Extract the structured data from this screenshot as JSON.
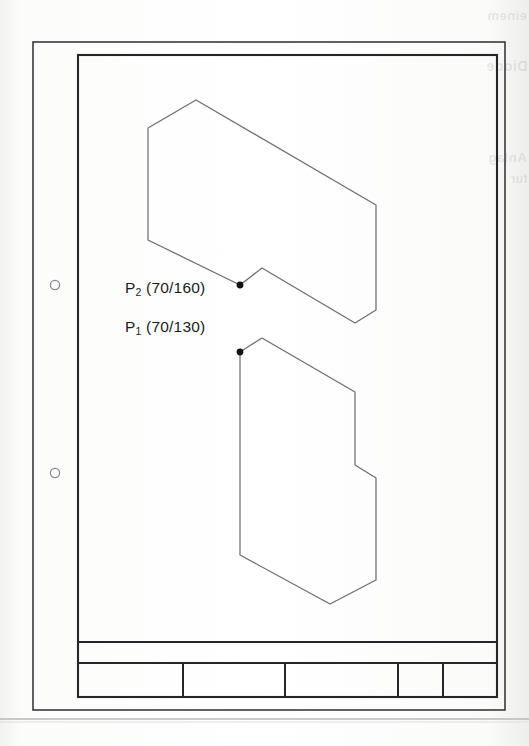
{
  "document": {
    "kind": "technical-drawing-scan",
    "page_width": 529,
    "page_height": 746,
    "background_color": "#fdfdfc",
    "line_color": "#6e6e73",
    "frame_color": "#2a2a2e",
    "ghost_text_right_margin": [
      "fur",
      "Diode",
      "Anlag",
      "einem"
    ]
  },
  "frame": {
    "outer": {
      "x": 33,
      "y": 42,
      "width": 472,
      "height": 668
    },
    "inner": {
      "x": 78,
      "y": 55,
      "width": 419,
      "height": 642
    },
    "bottom_rule_y": 718
  },
  "punch_holes": [
    {
      "cx": 55,
      "cy": 285,
      "r": 4.5
    },
    {
      "cx": 55,
      "cy": 473,
      "r": 4.5
    }
  ],
  "annotations": [
    {
      "id": "p2",
      "label_main": "P",
      "label_sub": "2",
      "label_coords": "(70/160)",
      "label_full": "P2 (70/160)",
      "x_value": 70,
      "y_value": 160,
      "text_x": 125,
      "text_y": 297,
      "point": {
        "cx": 240,
        "cy": 285,
        "r": 3.2
      }
    },
    {
      "id": "p1",
      "label_main": "P",
      "label_sub": "1",
      "label_coords": "(70/130)",
      "label_full": "P1 (70/130)",
      "x_value": 70,
      "y_value": 130,
      "text_x": 125,
      "text_y": 336,
      "point": {
        "cx": 240,
        "cy": 352,
        "r": 3.2
      }
    }
  ],
  "shapes": [
    {
      "name": "upper-polygon",
      "points": "196,100 148,128 148,240 240,285 262,268 355,323 376,310 376,205 196,100"
    },
    {
      "name": "lower-polygon",
      "points": "240,352 262,338 355,392 355,465 376,478 376,580 330,604 240,555 240,352"
    }
  ],
  "title_block": {
    "top_y": 642,
    "divider_y": 663,
    "bottom_y": 697,
    "left_x": 78,
    "right_x": 497,
    "upper_strip_cells": [
      {
        "label": ""
      }
    ],
    "lower_row_dividers_x": [
      183,
      285,
      398,
      443
    ],
    "lower_row_cells": [
      {
        "name": "cell-1",
        "label": ""
      },
      {
        "name": "cell-2",
        "label": ""
      },
      {
        "name": "cell-3",
        "label": ""
      },
      {
        "name": "cell-4",
        "label": ""
      },
      {
        "name": "cell-5",
        "label": ""
      }
    ]
  }
}
